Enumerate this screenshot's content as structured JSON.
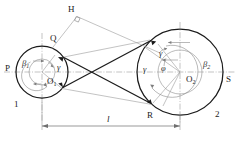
{
  "figure": {
    "caption_text": "",
    "stroke_color": "#1b1b1b",
    "thin_color": "#8a8a8a",
    "center_line_color": "#9b9b9b",
    "background": "#ffffff"
  },
  "points": {
    "P": "P",
    "Q": "Q",
    "H": "H",
    "R": "R",
    "S": "S",
    "O1": "O",
    "O1_sub": "1",
    "O2": "O",
    "O2_sub": "2"
  },
  "pulleys": [
    {
      "id": "pulley-1",
      "label": "1",
      "center_label": "O",
      "center_sub": "1",
      "cx": 42,
      "cy": 72,
      "r_outer": 26,
      "r_inner": 13
    },
    {
      "id": "pulley-2",
      "label": "2",
      "center_label": "O",
      "center_sub": "2",
      "cx": 180,
      "cy": 72,
      "r_outer": 43,
      "r_inner": 22
    }
  ],
  "angles": {
    "beta1": "β",
    "beta1_sub": "1",
    "beta2": "β",
    "beta2_sub": "2",
    "gamma_left": "γ",
    "gamma_right_upper": "γ",
    "gamma_right_lower": "γ",
    "phi": "φ"
  },
  "dimension": {
    "label": "l",
    "x_start": 42,
    "x_end": 180,
    "y": 126,
    "description": "centre distance between pulley axes"
  },
  "right_angle_marker": {
    "at": "H",
    "symbol": "right-angle-square"
  }
}
